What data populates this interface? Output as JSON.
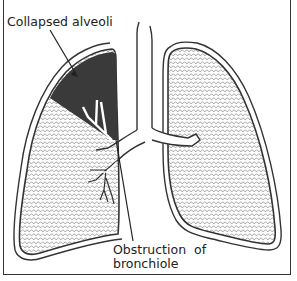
{
  "diagram": {
    "labels": {
      "collapsed": "Collapsed alveoli",
      "obstruction_line1": "Obstruction of",
      "obstruction_line2": "bronchiole"
    },
    "colors": {
      "outline": "#333333",
      "collapsed_region": "#3a3a3a",
      "alveoli_pattern": "#888888",
      "background": "#ffffff"
    }
  }
}
